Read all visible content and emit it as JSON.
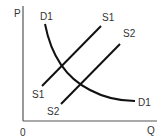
{
  "diagram": {
    "type": "supply-demand",
    "axes": {
      "y_label": "P",
      "x_label": "Q",
      "origin_label": "0"
    },
    "curves": {
      "demand": {
        "name": "D1",
        "label_top": "D1",
        "label_end": "D1"
      },
      "supply1": {
        "name": "S1",
        "label_start": "S1",
        "label_end": "S1"
      },
      "supply2": {
        "name": "S2",
        "label_start": "S2",
        "label_end": "S2"
      }
    },
    "colors": {
      "line": "#111111",
      "axis": "#555555",
      "text": "#333333"
    }
  }
}
